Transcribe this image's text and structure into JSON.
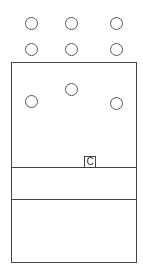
{
  "diagram": {
    "outside_circles": [
      {
        "x": 31,
        "y": 23
      },
      {
        "x": 71,
        "y": 23
      },
      {
        "x": 116,
        "y": 23
      },
      {
        "x": 31,
        "y": 49
      },
      {
        "x": 71,
        "y": 49
      },
      {
        "x": 116,
        "y": 49
      }
    ],
    "inside_circles": [
      {
        "x": 31,
        "y": 101
      },
      {
        "x": 71,
        "y": 89
      },
      {
        "x": 116,
        "y": 103
      }
    ],
    "divider_lines_y": [
      167,
      199
    ],
    "label_box": {
      "text": "C"
    },
    "colors": {
      "stroke": "#444444",
      "background": "#ffffff"
    }
  }
}
